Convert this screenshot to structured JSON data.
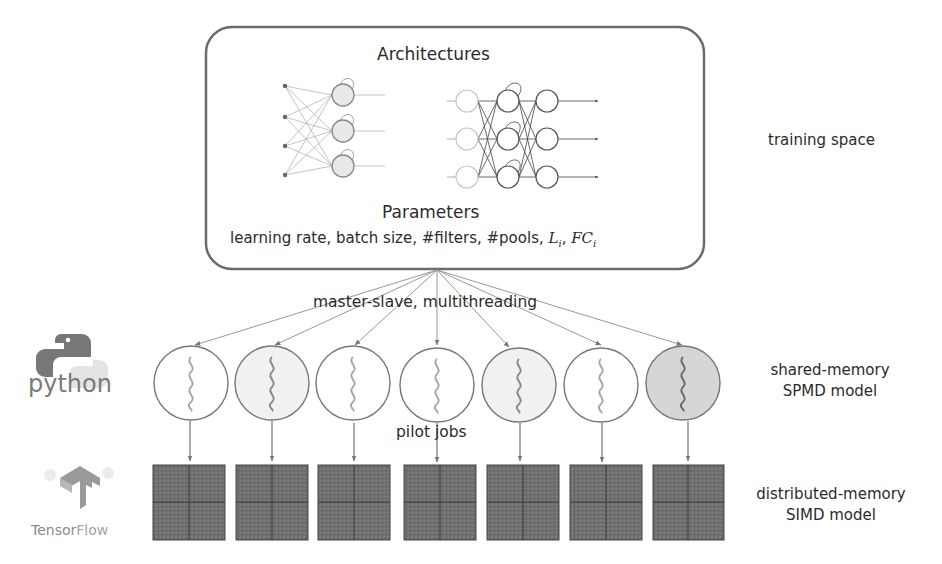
{
  "training_box": {
    "architectures_title": "Architectures",
    "parameters_title": "Parameters",
    "parameters_list_prefix": "learning rate, batch size, #filters, #pools, ",
    "param_L": "L",
    "param_L_sub": "i",
    "param_sep": ", ",
    "param_FC": "FC",
    "param_FC_sub": "i"
  },
  "fanout_label": "master-slave, multithreading",
  "pilot_label": "pilot jobs",
  "side_labels": {
    "training_space": "training space",
    "shared_memory_line1": "shared-memory",
    "shared_memory_line2": "SPMD model",
    "distributed_memory_line1": "distributed-memory",
    "distributed_memory_line2": "SIMD model"
  },
  "logos": {
    "python": "python",
    "tensorflow_part1": "Tensor",
    "tensorflow_part2": "Flow"
  },
  "workers": [
    {
      "x": 191,
      "fill": "#ffffff",
      "wave": "#a8a8a8"
    },
    {
      "x": 272,
      "fill": "#f1f1f1",
      "wave": "#8a8a8a"
    },
    {
      "x": 353,
      "fill": "#ffffff",
      "wave": "#a8a8a8"
    },
    {
      "x": 437,
      "fill": "#ffffff",
      "wave": "#a8a8a8"
    },
    {
      "x": 519,
      "fill": "#f1f1f1",
      "wave": "#8a8a8a"
    },
    {
      "x": 601,
      "fill": "#ffffff",
      "wave": "#a8a8a8"
    },
    {
      "x": 683,
      "fill": "#d6d6d6",
      "wave": "#6a6a6a"
    }
  ],
  "colors": {
    "box_stroke": "#6b6b6b",
    "grid_fill": "#6e6e6e",
    "grid_line": "#3a3a3a",
    "arrow": "#8a8a8a",
    "text": "#2b2b2b"
  }
}
